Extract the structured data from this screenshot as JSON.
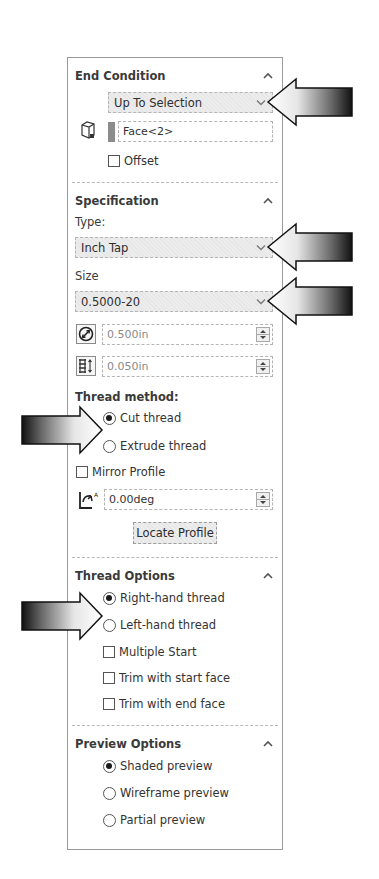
{
  "end_condition": {
    "title": "End Condition",
    "type_value": "Up To Selection",
    "face_value": "Face<2>",
    "offset_label": "Offset",
    "offset_checked": false
  },
  "specification": {
    "title": "Specification",
    "type_label": "Type:",
    "type_value": "Inch Tap",
    "size_label": "Size",
    "size_value": "0.5000-20",
    "diameter_value": "0.500in",
    "pitch_value": "0.050in",
    "thread_method_label": "Thread method:",
    "thread_methods": [
      {
        "label": "Cut thread",
        "selected": true
      },
      {
        "label": "Extrude thread",
        "selected": false
      }
    ],
    "mirror_profile_label": "Mirror Profile",
    "mirror_profile_checked": false,
    "angle_value": "0.00deg",
    "locate_profile_label": "Locate Profile"
  },
  "thread_options": {
    "title": "Thread Options",
    "hand": [
      {
        "label": "Right-hand thread",
        "selected": true
      },
      {
        "label": "Left-hand thread",
        "selected": false
      }
    ],
    "checkboxes": [
      {
        "label": "Multiple Start",
        "checked": false
      },
      {
        "label": "Trim with start face",
        "checked": false
      },
      {
        "label": "Trim with end face",
        "checked": false
      }
    ]
  },
  "preview_options": {
    "title": "Preview Options",
    "options": [
      {
        "label": "Shaded preview",
        "selected": true
      },
      {
        "label": "Wireframe preview",
        "selected": false
      },
      {
        "label": "Partial preview",
        "selected": false
      }
    ]
  },
  "colors": {
    "panel_border": "#9a9a9a",
    "dropdown_bg": "#e9e9e9",
    "text": "#2b2b2b",
    "face_swatch": "#8c8c8c"
  }
}
